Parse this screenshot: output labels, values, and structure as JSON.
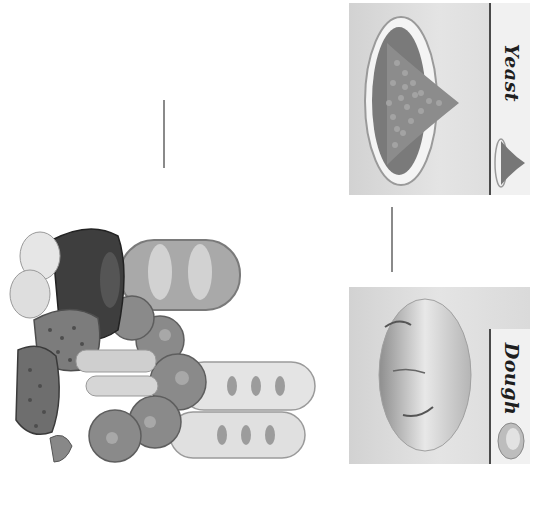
{
  "diagram": {
    "orientation": "rotated 90deg clockwise",
    "nodes": [
      {
        "id": "yeast",
        "label": "Yeast",
        "icon": "yeast-bowl-icon"
      },
      {
        "id": "dough",
        "label": "Dough",
        "icon": "dough-ball-icon"
      },
      {
        "id": "breads",
        "label": "",
        "icon": "bread-products-illustration"
      }
    ],
    "edges": [
      {
        "from": "yeast",
        "to": "dough"
      },
      {
        "from": "dough",
        "to": "breads"
      }
    ]
  },
  "colors": {
    "background": "#ffffff",
    "panel": "#d9d9d9",
    "label_strip": "#f1f1f1",
    "label_text": "#1e1e1e",
    "connector": "#8a8a8a"
  }
}
